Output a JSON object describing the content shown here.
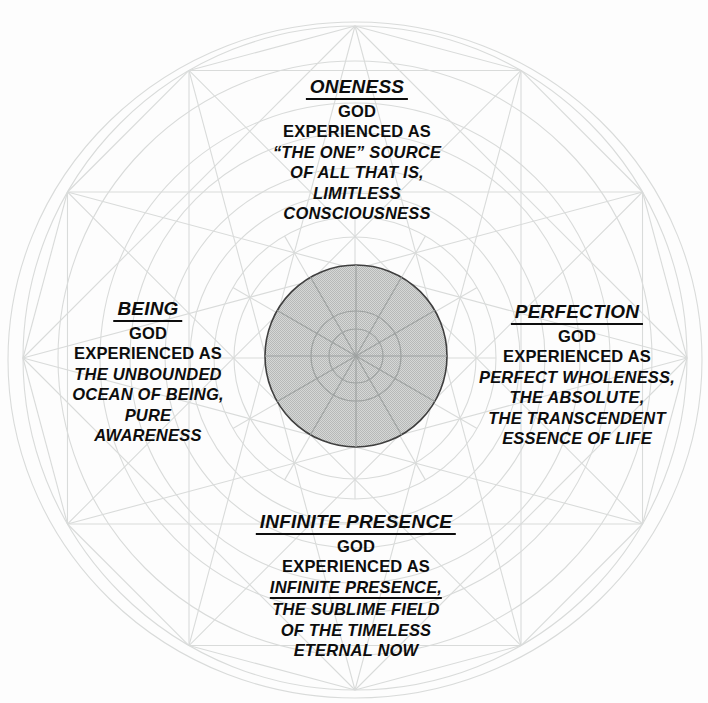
{
  "page": {
    "background": "#fdfdfd"
  },
  "colors": {
    "line": "#d9dbda",
    "disc_fill_light": "#d5d7d6",
    "disc_fill_dark": "#b7b9b8",
    "disc_outline": "#3f3f3f",
    "disc_inner_line": "#9ea2a1",
    "text": "#0d0d0d"
  },
  "labels": {
    "top": {
      "title": "ONENESS",
      "lines": [
        "GOD",
        "EXPERIENCED AS",
        "“THE ONE” SOURCE",
        "OF ALL THAT IS,",
        "LIMITLESS",
        "CONSCIOUSNESS"
      ]
    },
    "left": {
      "title": "BEING",
      "lines": [
        "GOD",
        "EXPERIENCED AS",
        "THE UNBOUNDED",
        "OCEAN OF BEING,",
        "PURE",
        "AWARENESS"
      ]
    },
    "right": {
      "title": "PERFECTION",
      "lines": [
        "GOD",
        "EXPERIENCED AS",
        "PERFECT WHOLENESS,",
        "THE ABSOLUTE,",
        "THE TRANSCENDENT",
        "ESSENCE OF LIFE"
      ]
    },
    "bottom": {
      "title": "INFINITE PRESENCE",
      "lines": [
        "GOD",
        "EXPERIENCED AS",
        "INFINITE PRESENCE,",
        "THE SUBLIME FIELD",
        "OF THE TIMELESS",
        "ETERNAL NOW"
      ]
    }
  }
}
